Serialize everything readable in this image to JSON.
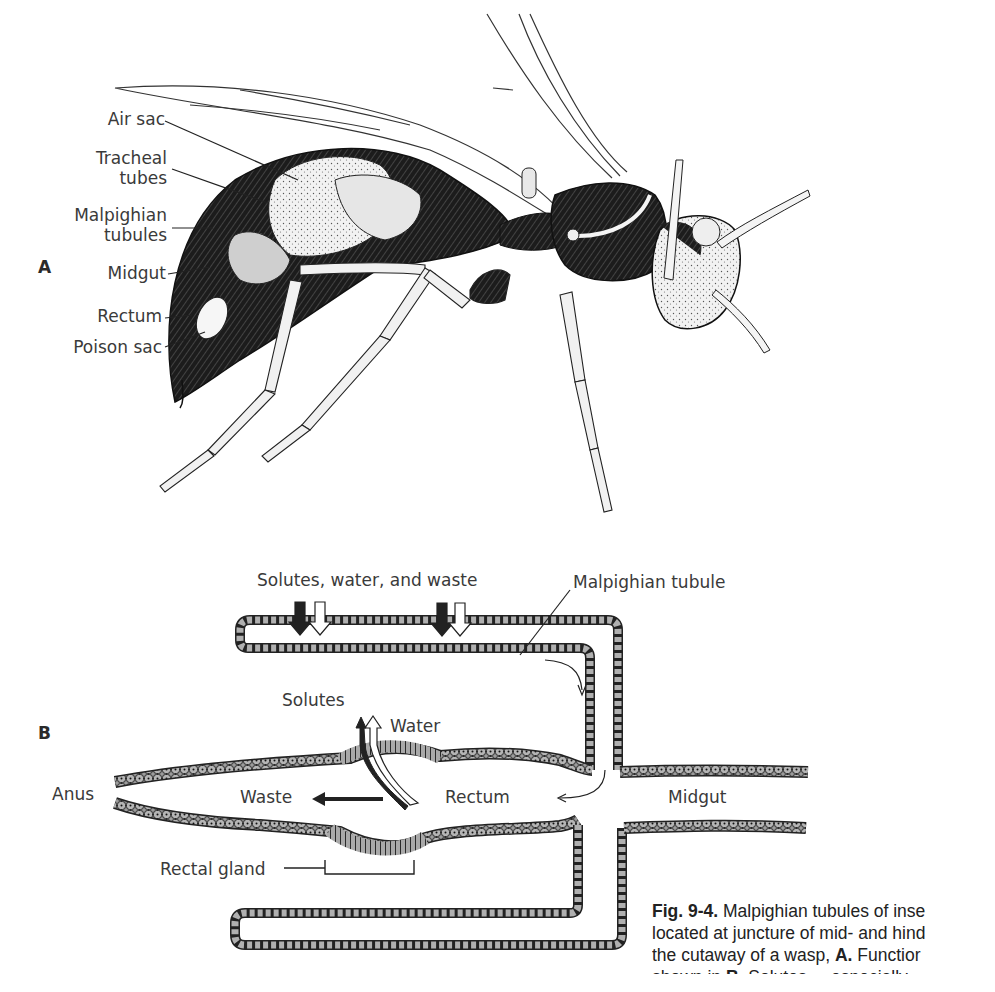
{
  "figure": {
    "panel_a": {
      "letter": "A",
      "subject": "Cutaway of a wasp",
      "labels": [
        {
          "id": "air-sac",
          "lines": [
            "Air sac"
          ]
        },
        {
          "id": "tracheal-tubes",
          "lines": [
            "Tracheal",
            "tubes"
          ]
        },
        {
          "id": "malpighian-tubules",
          "lines": [
            "Malpighian",
            "tubules"
          ]
        },
        {
          "id": "midgut",
          "lines": [
            "Midgut"
          ]
        },
        {
          "id": "rectum",
          "lines": [
            "Rectum"
          ]
        },
        {
          "id": "poison-sac",
          "lines": [
            "Poison sac"
          ]
        }
      ]
    },
    "panel_b": {
      "letter": "B",
      "labels": {
        "inflow": "Solutes, water, and waste",
        "tubule": "Malpighian tubule",
        "solutes": "Solutes",
        "water": "Water",
        "waste": "Waste",
        "anus": "Anus",
        "rectum": "Rectum",
        "midgut": "Midgut",
        "rectal_gland": "Rectal gland"
      },
      "arrow_colors": {
        "solutes_waste": "#222222",
        "water": "#ffffff"
      }
    },
    "caption": {
      "number": "Fig. 9-4.",
      "line1": " Malpighian tubules of inse",
      "line2": "located at juncture of mid- and hind",
      "line3_a": "the cutaway of a wasp, ",
      "line3_b": "A.",
      "line3_c": " Functior",
      "line4_a": "shown in ",
      "line4_b": "B.",
      "line4_c": " Solutes ... especially"
    }
  }
}
